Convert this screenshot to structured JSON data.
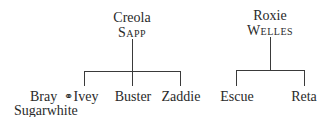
{
  "families": [
    {
      "parent": {
        "first": "Creola",
        "last": "Sapp"
      },
      "children": [
        {
          "name": "Ivey",
          "spouse": "Bray Sugarwhite",
          "spouse_first": "Bray",
          "spouse_last": "Sugarwhite",
          "marriage_symbol": "⚭"
        },
        {
          "name": "Buster"
        },
        {
          "name": "Zaddie"
        }
      ]
    },
    {
      "parent": {
        "first": "Roxie",
        "last": "Welles"
      },
      "children": [
        {
          "name": "Escue"
        },
        {
          "name": "Reta"
        }
      ]
    }
  ]
}
